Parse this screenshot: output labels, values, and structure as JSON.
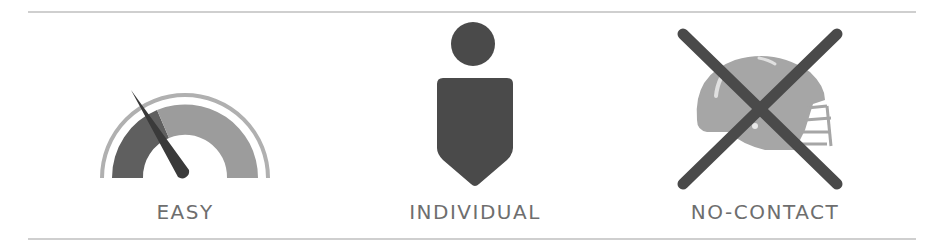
{
  "features": [
    {
      "label": "EASY",
      "icon": "speedometer-gauge-icon"
    },
    {
      "label": "INDIVIDUAL",
      "icon": "person-icon"
    },
    {
      "label": "NO-CONTACT",
      "icon": "crossed-out-football-helmet-icon"
    }
  ],
  "colors": {
    "dark": "#4a4a4a",
    "mid": "#8a8a8a",
    "light": "#b5b5b5",
    "text": "#6e6e6e",
    "rule": "#cfcfcf"
  }
}
